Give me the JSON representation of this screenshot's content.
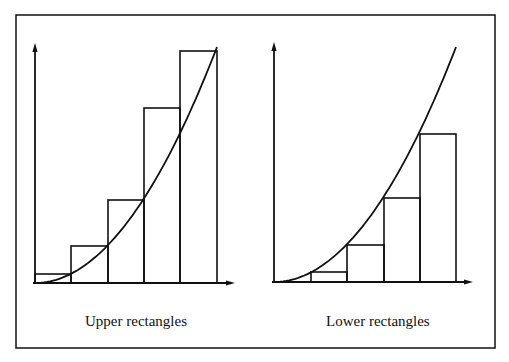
{
  "figure": {
    "frame": {
      "x1": 16,
      "y1": 15,
      "x2": 495,
      "y2": 348
    },
    "stroke_color": "#111111",
    "background": "#ffffff"
  },
  "panels": [
    {
      "id": "upper",
      "caption": "Upper rectangles",
      "caption_pos": {
        "x": 85,
        "y": 313
      },
      "axes": {
        "origin": {
          "x": 35,
          "y": 283
        },
        "y_top": 43,
        "x_right": 235
      },
      "rect_edges_x": [
        35,
        71,
        108,
        144,
        180,
        217
      ],
      "rect_tops_y": [
        274,
        246,
        200,
        108,
        51
      ],
      "curve": {
        "x_start": 35,
        "x_end": 217,
        "y_bottom": 283,
        "y_top": 47
      }
    },
    {
      "id": "lower",
      "caption": "Lower rectangles",
      "caption_pos": {
        "x": 326,
        "y": 313
      },
      "axes": {
        "origin": {
          "x": 274,
          "y": 282
        },
        "y_top": 42,
        "x_right": 473
      },
      "rect_edges_x": [
        274,
        311,
        347,
        384,
        420,
        456
      ],
      "rect_tops_y": [
        282,
        272,
        245,
        198,
        134
      ],
      "curve": {
        "x_start": 274,
        "x_end": 456,
        "y_bottom": 282,
        "y_top": 47
      }
    }
  ]
}
